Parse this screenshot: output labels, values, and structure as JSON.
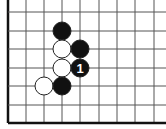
{
  "diagram": {
    "type": "go-board-fragment",
    "partial_label": ")",
    "grid": {
      "columns_x": [
        8,
        26,
        44,
        62,
        80,
        99,
        117,
        135,
        154
      ],
      "rows_y": [
        12,
        31,
        49,
        68,
        86,
        105,
        123
      ],
      "left_edge_thick": true,
      "bottom_edge_thick": true,
      "line_color": "#555555",
      "edge_color": "#111111"
    },
    "stones": [
      {
        "color": "black",
        "col": 3,
        "row": 1,
        "label": ""
      },
      {
        "color": "white",
        "col": 3,
        "row": 2,
        "label": ""
      },
      {
        "color": "black",
        "col": 4,
        "row": 2,
        "label": ""
      },
      {
        "color": "white",
        "col": 3,
        "row": 3,
        "label": ""
      },
      {
        "color": "black",
        "col": 4,
        "row": 3,
        "label": "1"
      },
      {
        "color": "white",
        "col": 2,
        "row": 4,
        "label": ""
      },
      {
        "color": "black",
        "col": 3,
        "row": 4,
        "label": ""
      }
    ],
    "stone_radius": 9,
    "colors": {
      "black_stone": "#111111",
      "white_stone": "#ffffff",
      "stone_outline": "#222222",
      "move_number": "#ffffff"
    }
  }
}
